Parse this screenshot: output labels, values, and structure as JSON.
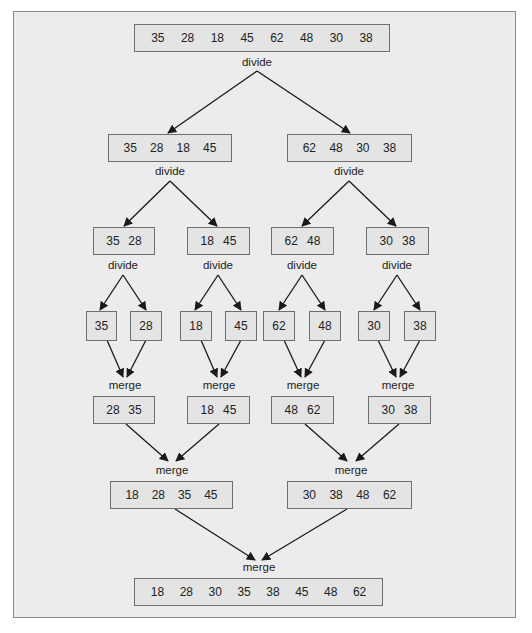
{
  "diagram": {
    "labels": {
      "divide": "divide",
      "merge": "merge"
    },
    "level0": {
      "values": [
        "35",
        "28",
        "18",
        "45",
        "62",
        "48",
        "30",
        "38"
      ]
    },
    "level1": [
      {
        "values": [
          "35",
          "28",
          "18",
          "45"
        ]
      },
      {
        "values": [
          "62",
          "48",
          "30",
          "38"
        ]
      }
    ],
    "level2": [
      {
        "values": [
          "35",
          "28"
        ]
      },
      {
        "values": [
          "18",
          "45"
        ]
      },
      {
        "values": [
          "62",
          "48"
        ]
      },
      {
        "values": [
          "30",
          "38"
        ]
      }
    ],
    "level3": [
      {
        "values": [
          "35"
        ]
      },
      {
        "values": [
          "28"
        ]
      },
      {
        "values": [
          "18"
        ]
      },
      {
        "values": [
          "45"
        ]
      },
      {
        "values": [
          "62"
        ]
      },
      {
        "values": [
          "48"
        ]
      },
      {
        "values": [
          "30"
        ]
      },
      {
        "values": [
          "38"
        ]
      }
    ],
    "level4": [
      {
        "values": [
          "28",
          "35"
        ]
      },
      {
        "values": [
          "18",
          "45"
        ]
      },
      {
        "values": [
          "48",
          "62"
        ]
      },
      {
        "values": [
          "30",
          "38"
        ]
      }
    ],
    "level5": [
      {
        "values": [
          "18",
          "28",
          "35",
          "45"
        ]
      },
      {
        "values": [
          "30",
          "38",
          "48",
          "62"
        ]
      }
    ],
    "level6": {
      "values": [
        "18",
        "28",
        "30",
        "35",
        "38",
        "45",
        "48",
        "62"
      ]
    }
  },
  "colors": {
    "frame_bg": "#ececec",
    "frame_border": "#8a8a8a",
    "box_bg": "#e4e4e4",
    "box_border": "#6f6f6f",
    "arrow": "#1a1a1a"
  }
}
